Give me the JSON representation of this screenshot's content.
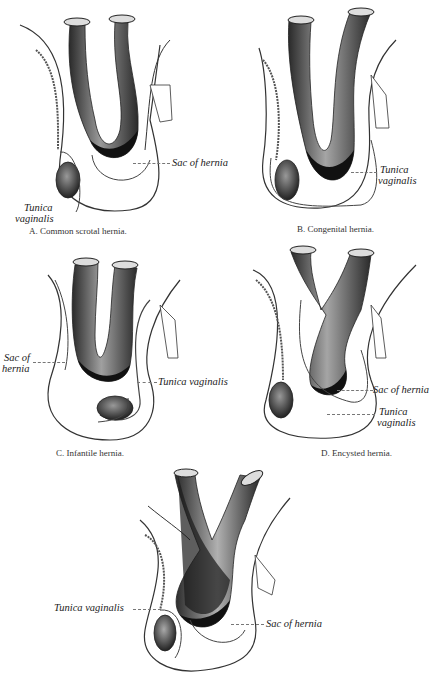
{
  "figure": {
    "panels": [
      {
        "id": "A",
        "caption": "A. Common scrotal hernia.",
        "labels": {
          "sac": "Sac of hernia",
          "tunica_1": "Tunica",
          "tunica_2": "vaginalis"
        }
      },
      {
        "id": "B",
        "caption": "B. Congenital hernia.",
        "labels": {
          "sac": "Sac of hernia",
          "tunica_1": "Tunica",
          "tunica_2": "vaginalis"
        }
      },
      {
        "id": "C",
        "caption": "C. Infantile hernia.",
        "labels": {
          "sac_1": "Sac of",
          "sac_2": "hernia",
          "tunica": "Tunica vaginalis"
        }
      },
      {
        "id": "D",
        "caption": "D. Encysted hernia.",
        "labels": {
          "sac": "Sac of hernia",
          "tunica_1": "Tunica",
          "tunica_2": "vaginalis"
        }
      },
      {
        "id": "E",
        "caption": "",
        "labels": {
          "tunica": "Tunica vaginalis",
          "sac": "Sac of hernia"
        }
      }
    ],
    "colors": {
      "ink": "#222222",
      "shade_dark": "#1a1a1a",
      "shade_mid": "#6a6a6a",
      "paper": "#ffffff"
    }
  }
}
